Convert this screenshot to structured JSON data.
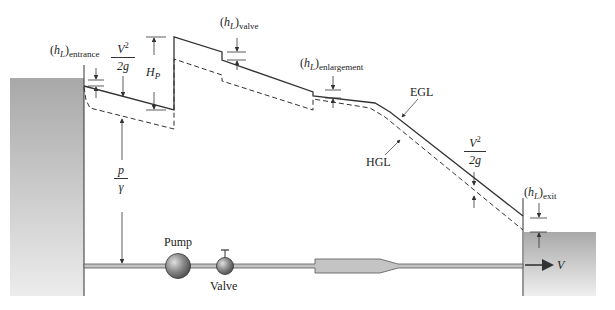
{
  "diagram": {
    "labels": {
      "hl_symbol": "h",
      "hl_sub": "L",
      "entrance": "entrance",
      "valve_loss": "valve",
      "enlargement": "enlargement",
      "exit": "exit",
      "velocity_head_num": "V",
      "velocity_head_exp": "2",
      "velocity_head_den": "2g",
      "pump_head": "H",
      "pump_head_sub": "P",
      "pressure_head_num": "p",
      "pressure_head_den": "γ",
      "egl": "EGL",
      "hgl": "HGL",
      "pump": "Pump",
      "valve": "Valve",
      "velocity": "V"
    },
    "colors": {
      "line": "#333333",
      "reservoir_top": "#a8a8a8",
      "reservoir_bottom": "#e8e8e8",
      "pipe_fill": "#bdbdbd",
      "background": "#ffffff"
    }
  }
}
